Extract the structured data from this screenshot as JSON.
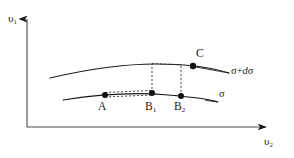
{
  "figure": {
    "background_color": "#ffffff",
    "line_color": "#1a1a1a",
    "dash_color": "#3a3a3a"
  },
  "axes": {
    "y_label": "υ",
    "y_label_sub": "1",
    "x_label": "υ",
    "x_label_sub": "2",
    "origin": {
      "x": 27,
      "y": 127
    },
    "y_top": 15,
    "x_right": 272
  },
  "curves": [
    {
      "name": "sigma-curve",
      "label": "σ",
      "label_italic": "",
      "style": "solid",
      "path": "M 63 100 C 95 95, 135 92, 168 95 C 192 97, 212 100, 218 102"
    },
    {
      "name": "sigma-plus-dsigma-curve",
      "label": "σ+",
      "label_italic": "d",
      "label_tail": "σ",
      "style": "solid",
      "path": "M 50 78 C 84 70, 124 64, 156 64 C 186 64, 213 68, 229 73"
    }
  ],
  "points": [
    {
      "name": "point-A",
      "label": "A",
      "sub": "",
      "x": 105,
      "y": 95
    },
    {
      "name": "point-B1",
      "label": "B",
      "sub": "1",
      "x": 152,
      "y": 93
    },
    {
      "name": "point-B2",
      "label": "B",
      "sub": "2",
      "x": 181,
      "y": 96
    },
    {
      "name": "point-C",
      "label": "C",
      "sub": "",
      "x": 193,
      "y": 66
    }
  ],
  "dashed_connectors": [
    {
      "name": "loop-upper-A-B1",
      "path": "M 105 92.5 L 152 90.5"
    },
    {
      "name": "loop-lower-A-B1",
      "path": "M 105 97 L 152 95"
    },
    {
      "name": "loop-cap-A",
      "path": "M 105 92.5 L 105 97"
    },
    {
      "name": "loop-cap-B1",
      "path": "M 152 90.5 L 152 95"
    },
    {
      "name": "vertical-B1-to-upper",
      "path": "M 152 93 L 152 63.5"
    },
    {
      "name": "vertical-B2-to-upper",
      "path": "M 181 96 L 181 65"
    },
    {
      "name": "horizontal-top",
      "path": "M 152 63.5 L 181 65"
    },
    {
      "name": "segment-to-C",
      "path": "M 181 65 L 193 66"
    }
  ]
}
